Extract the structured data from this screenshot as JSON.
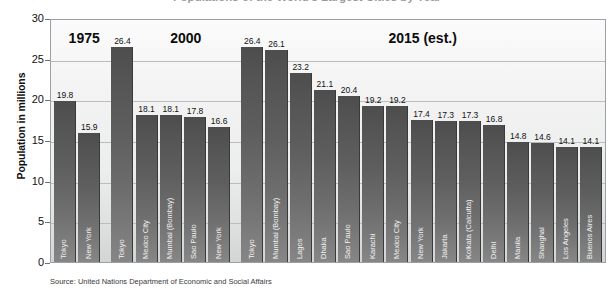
{
  "title": "Populations of the World's Largest Cities by Year",
  "source": "Source:  United Nations Department of Economic and Social Affairs",
  "axes": {
    "y_title": "Population in millions",
    "y_ticks": [
      "30",
      "25",
      "20",
      "15",
      "10",
      "5",
      "0"
    ]
  },
  "era_headings": [
    {
      "label": "1975"
    },
    {
      "label": "2000"
    },
    {
      "label": "2015 (est.)"
    }
  ],
  "chart_data": {
    "type": "bar",
    "title": "Populations of the World's Largest Cities by Year",
    "xlabel": "",
    "ylabel": "Population in millions",
    "ylim": [
      0,
      30
    ],
    "ytick_step": 5,
    "grid": true,
    "legend": "none",
    "bar_color": "#5e5e5e",
    "groups": [
      {
        "name": "1975",
        "categories": [
          "Tokyo",
          "New York"
        ],
        "values": [
          19.8,
          15.9
        ]
      },
      {
        "name": "2000",
        "categories": [
          "Tokyo",
          "Mexico City",
          "Mumbai (Bombay)",
          "Sao Paulo",
          "New York"
        ],
        "values": [
          26.4,
          18.1,
          18.1,
          17.8,
          16.6
        ]
      },
      {
        "name": "2015 (est.)",
        "categories": [
          "Tokyo",
          "Mumbai (Bombay)",
          "Lagos",
          "Dhaka",
          "Sao Paulo",
          "Karachi",
          "Mexico City",
          "New York",
          "Jakarta",
          "Kolkata (Calcutta)",
          "Delhi",
          "Manila",
          "Shanghai",
          "Los Angeles",
          "Buenos Aires"
        ],
        "values": [
          26.4,
          26.1,
          23.2,
          21.1,
          20.4,
          19.2,
          19.2,
          17.4,
          17.3,
          17.3,
          16.8,
          14.8,
          14.6,
          14.1,
          14.1
        ]
      }
    ]
  }
}
